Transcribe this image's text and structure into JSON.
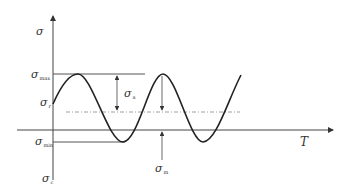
{
  "diagram": {
    "type": "cyclic stress waveform",
    "labels": {
      "sigma": "σ",
      "sigma_max": {
        "sym": "σ",
        "sub": "max"
      },
      "sigma_r": {
        "sym": "σ",
        "sub": "r"
      },
      "sigma_a": {
        "sym": "σ",
        "sub": "a"
      },
      "sigma_min": {
        "sym": "σ",
        "sub": "min"
      },
      "sigma_m": {
        "sym": "σ",
        "sub": "m"
      },
      "sigma_c": {
        "sym": "σ",
        "sub": "c"
      },
      "time_axis": "T"
    },
    "colors": {
      "curve": "#222222",
      "axis": "#444444",
      "reference_lines": "#555555",
      "mean_line": "#888888"
    }
  }
}
